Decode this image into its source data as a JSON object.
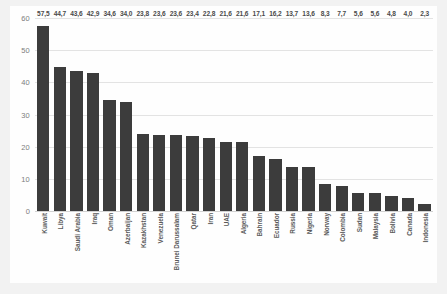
{
  "chart_data": {
    "type": "bar",
    "title": "",
    "subtitle": "",
    "xlabel": "",
    "ylabel": "",
    "ylim": [
      0,
      60
    ],
    "yticks": [
      "0",
      "10",
      "20",
      "30",
      "40",
      "50",
      "60"
    ],
    "grid": true,
    "legend": "none",
    "decimal_separator": ",",
    "bar_color": "#3c3c3c",
    "categories": [
      "Kuwait",
      "Libya",
      "Saudi Arabia",
      "Iraq",
      "Oman",
      "Azerbaijan",
      "Kazakhstan",
      "Venezuela",
      "Brunei Darussalam",
      "Qatar",
      "Iran",
      "UAE",
      "Algeria",
      "Bahrain",
      "Ecuador",
      "Russia",
      "Nigeria",
      "Norway",
      "Colombia",
      "Sudan",
      "Malaysia",
      "Bolivia",
      "Canada",
      "Indonesia"
    ],
    "values": [
      57.5,
      44.7,
      43.6,
      42.9,
      34.6,
      34.0,
      23.8,
      23.6,
      23.6,
      23.4,
      22.8,
      21.6,
      21.6,
      17.1,
      16.2,
      13.7,
      13.6,
      8.3,
      7.7,
      5.6,
      5.6,
      4.8,
      4.0,
      2.3
    ],
    "value_labels": [
      "57,5",
      "44,7",
      "43,6",
      "42,9",
      "34,6",
      "34,0",
      "23,8",
      "23,6",
      "23,6",
      "23,4",
      "22,8",
      "21,6",
      "21,6",
      "17,1",
      "16,2",
      "13,7",
      "13,6",
      "8,3",
      "7,7",
      "5,6",
      "5,6",
      "4,8",
      "4,0",
      "2,3"
    ]
  }
}
